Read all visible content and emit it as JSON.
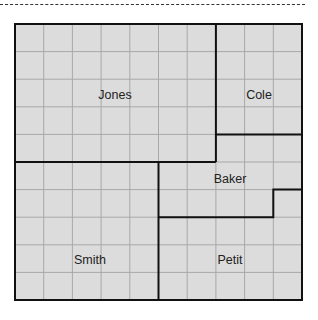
{
  "diagram": {
    "type": "grid-partition",
    "grid": {
      "cols": 10,
      "rows": 10,
      "fill": "#dcdcdc",
      "grid_line_color": "#a8a8a8",
      "border_color": "#111111"
    },
    "regions": [
      {
        "name": "Jones",
        "cells": "cols 0-6, rows 0-4"
      },
      {
        "name": "Cole",
        "cells": "cols 7-9, rows 0-3"
      },
      {
        "name": "Baker",
        "cells": "cols 7-9 row 4; cols 5-9 rows 5; cols 5-8 row 6"
      },
      {
        "name": "Smith",
        "cells": "cols 0-4, rows 5-9"
      },
      {
        "name": "Petit",
        "cells": "cols 5-9 rows 7-9; col 9 row 6"
      }
    ]
  },
  "labels": {
    "jones": "Jones",
    "cole": "Cole",
    "baker": "Baker",
    "smith": "Smith",
    "petit": "Petit"
  }
}
